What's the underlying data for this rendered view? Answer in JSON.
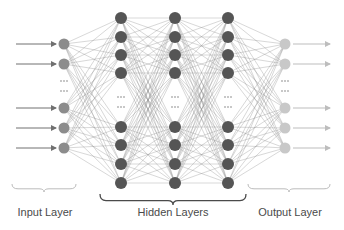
{
  "diagram": {
    "labels": {
      "input": "Input Layer",
      "hidden": "Hidden Layers",
      "output": "Output Layer"
    },
    "colors": {
      "input_node": "#8c8c8c",
      "hidden_node": "#555555",
      "output_node": "#c8c8c8",
      "edge": "#8a8a8a",
      "input_arrow": "#707070",
      "output_arrow": "#bdbdbd",
      "brace_light": "#bcbcbc",
      "brace_dark": "#4a4a4a"
    },
    "layers": [
      {
        "name": "input",
        "x": 64,
        "node_y": [
          44,
          64,
          108,
          128,
          148
        ],
        "ellipsis_y": [
          81,
          91
        ],
        "radius": 5.5
      },
      {
        "name": "hidden-1",
        "x": 121,
        "node_y": [
          18,
          37,
          55,
          73,
          127,
          145,
          164,
          183
        ],
        "ellipsis_y": [
          97,
          107
        ],
        "radius": 6
      },
      {
        "name": "hidden-2",
        "x": 175,
        "node_y": [
          18,
          37,
          55,
          73,
          127,
          145,
          164,
          183
        ],
        "ellipsis_y": [
          97,
          107
        ],
        "radius": 6
      },
      {
        "name": "hidden-3",
        "x": 228,
        "node_y": [
          18,
          37,
          55,
          73,
          127,
          145,
          164,
          183
        ],
        "ellipsis_y": [
          97,
          107
        ],
        "radius": 6
      },
      {
        "name": "output",
        "x": 285,
        "node_y": [
          44,
          64,
          108,
          128,
          148
        ],
        "ellipsis_y": [
          81,
          91
        ],
        "radius": 5.5
      }
    ],
    "input_arrows": {
      "x_start": 16,
      "x_end": 56
    },
    "output_arrows": {
      "x_start": 293,
      "x_end": 330
    },
    "braces": [
      {
        "name": "input-brace",
        "x1": 12,
        "x2": 76,
        "y": 184,
        "depth": 8,
        "tone": "light"
      },
      {
        "name": "hidden-brace",
        "x1": 100,
        "x2": 246,
        "y": 194,
        "depth": 11,
        "tone": "dark"
      },
      {
        "name": "output-brace",
        "x1": 248,
        "x2": 330,
        "y": 184,
        "depth": 8,
        "tone": "light"
      }
    ]
  }
}
